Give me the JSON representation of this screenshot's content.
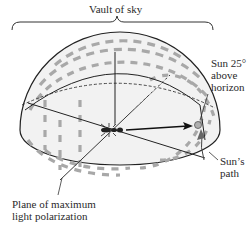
{
  "diagram": {
    "title_label": "Vault of sky",
    "sun_label_lines": [
      "Sun 25°",
      "above",
      "horizon"
    ],
    "sun_path_label_lines": [
      "Sun’s",
      "path"
    ],
    "polarization_label_lines": [
      "Plane of maximum",
      "light polarization"
    ],
    "colors": {
      "dome_fill": "#f2f2f2",
      "dash_color": "#a8a8a8",
      "line_color": "#222222",
      "sun_fill": "#b0b0b0"
    }
  }
}
